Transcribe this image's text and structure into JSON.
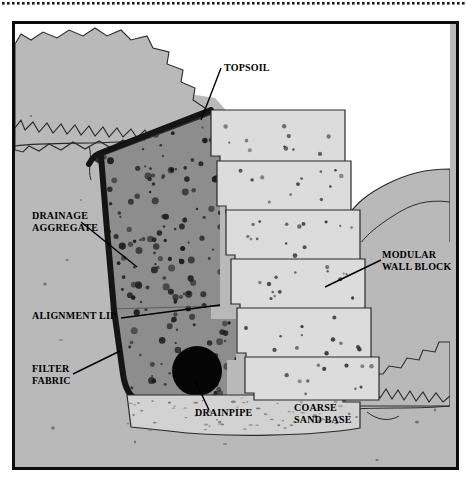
{
  "diagram": {
    "frame": {
      "border_color": "#0c0c0c",
      "background_color": "#b9b9b9"
    },
    "top_strip": {
      "name": "perforated-edge",
      "dot_color": "#1a1a1a",
      "dot_count": 93
    },
    "labels": [
      {
        "id": "topsoil",
        "text": "TOPSOIL",
        "x": 209,
        "y": 45,
        "align": "left"
      },
      {
        "id": "drainage-aggregate",
        "text": "DRAINAGE\nAGGREGATE",
        "x": 18,
        "y": 192,
        "align": "left"
      },
      {
        "id": "modular-wall-block",
        "text": "MODULAR\nWALL BLOCK",
        "x": 369,
        "y": 231,
        "align": "left"
      },
      {
        "id": "alignment-lip",
        "text": "ALIGNMENT LIP",
        "x": 18,
        "y": 291,
        "align": "left"
      },
      {
        "id": "filter-fabric",
        "text": "FILTER\nFABRIC",
        "x": 18,
        "y": 345,
        "align": "left"
      },
      {
        "id": "drainpipe",
        "text": "DRAINPIPE",
        "x": 182,
        "y": 389,
        "align": "left"
      },
      {
        "id": "coarse-sand-base",
        "text": "COARSE\nSAND BASE",
        "x": 280,
        "y": 385,
        "align": "left"
      }
    ],
    "colors": {
      "soil": "#b9b9b9",
      "aggregate": "#8d8d8d",
      "aggregate_speckle": "#1c1c1c",
      "block_face": "#dcdcdc",
      "block_speckle": "#3a3a3a",
      "sand_base": "#d2d2d2",
      "filter_fabric": "#141414",
      "drainpipe": "#050505",
      "sky": "#ffffff",
      "outline": "#2a2a2a",
      "leader": "#000000"
    },
    "components": {
      "wall_blocks_count": 6,
      "wall_block_setback": "stepped back toward the retained soil",
      "drainpipe_shape": "circle",
      "filter_fabric_shape": "wraps the back and base of the drainage aggregate",
      "sand_base_shape": "trench beneath the lowest block"
    }
  }
}
